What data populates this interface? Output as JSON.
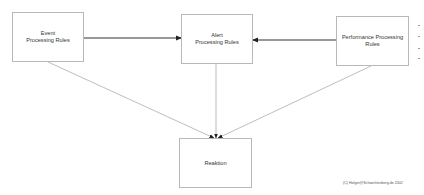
{
  "diagram": {
    "nodes": [
      {
        "id": "event",
        "label": "Event\nProcessing Rules",
        "x": 12,
        "y": 12,
        "w": 72,
        "h": 50
      },
      {
        "id": "alert",
        "label": "Alert\nProcessing Rules",
        "x": 181,
        "y": 14,
        "w": 72,
        "h": 50
      },
      {
        "id": "performance",
        "label": "Performance Processing\nRules",
        "x": 336,
        "y": 16,
        "w": 73,
        "h": 50
      },
      {
        "id": "reaktion",
        "label": "Reaktion",
        "x": 179,
        "y": 138,
        "w": 73,
        "h": 50
      }
    ],
    "edges": [
      {
        "from": "event",
        "to": "alert",
        "style": "bold-arrow"
      },
      {
        "from": "performance",
        "to": "alert",
        "style": "bold-arrow"
      },
      {
        "from": "event",
        "to": "reaktion",
        "style": "thin-arrow"
      },
      {
        "from": "alert",
        "to": "reaktion",
        "style": "thin-arrow"
      },
      {
        "from": "performance",
        "to": "reaktion",
        "style": "thin-arrow"
      }
    ],
    "copyright": "(C) Holger@Schwichtenberg.de 2002",
    "colors": {
      "box_border": "#b8b8b8",
      "bold_line": "#333333",
      "thin_line": "#a0a0a0",
      "text": "#333333"
    }
  }
}
